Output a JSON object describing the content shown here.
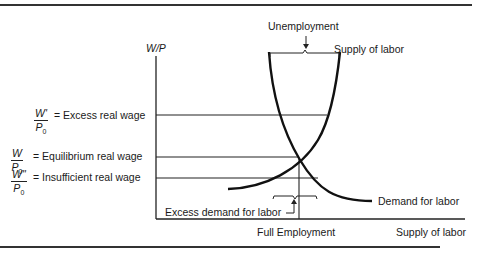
{
  "diagram": {
    "y_axis_label": "W/P",
    "x_axis_label": "Supply of labor",
    "full_employment_label": "Full Employment",
    "curves": {
      "supply": "Supply of labor",
      "demand": "Demand for labor"
    },
    "annotations": {
      "unemployment": "Unemployment",
      "excess_demand": "Excess demand for labor"
    },
    "wage_levels": [
      {
        "num": "W'",
        "den": "P",
        "den_sub": "0",
        "text": "= Excess real wage"
      },
      {
        "num": "W",
        "den": "P",
        "den_sub": "0",
        "text": "= Equilibrium real wage"
      },
      {
        "num": "W\"",
        "den": "P",
        "den_sub": "0",
        "text": "= Insufficient real wage"
      }
    ]
  }
}
